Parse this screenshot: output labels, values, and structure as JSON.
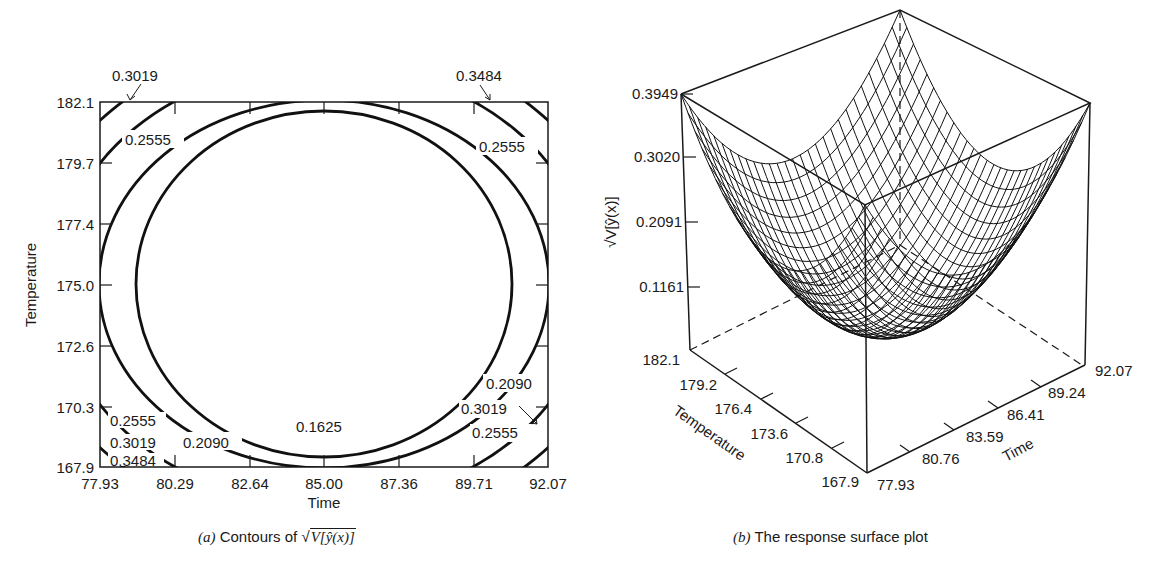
{
  "chart_data": [
    {
      "type": "contour",
      "panel": "(a)",
      "title": "Contours of √V[ŷ(x)]",
      "xlabel": "Time",
      "ylabel": "Temperature",
      "x_ticks": [
        "77.93",
        "80.29",
        "82.64",
        "85.00",
        "87.36",
        "89.71",
        "92.07"
      ],
      "y_ticks": [
        "182.1",
        "179.7",
        "177.4",
        "175.0",
        "172.6",
        "170.3",
        "167.9"
      ],
      "xlim": [
        77.93,
        92.07
      ],
      "ylim": [
        167.9,
        182.1
      ],
      "contour_levels": [
        0.1625,
        0.209,
        0.2555,
        0.3019,
        0.3484
      ],
      "contour_labels": [
        {
          "text": "0.3019",
          "position": "top-left (arrow)"
        },
        {
          "text": "0.3484",
          "position": "top-right (arrow)"
        },
        {
          "text": "0.2555",
          "position": "upper-left"
        },
        {
          "text": "0.2555",
          "position": "upper-right"
        },
        {
          "text": "0.2555",
          "position": "lower-left"
        },
        {
          "text": "0.3019",
          "position": "lower-left"
        },
        {
          "text": "0.3484",
          "position": "lower-left"
        },
        {
          "text": "0.2090",
          "position": "lower-left"
        },
        {
          "text": "0.1625",
          "position": "bottom-center"
        },
        {
          "text": "0.2090",
          "position": "lower-right"
        },
        {
          "text": "0.3019",
          "position": "lower-right"
        },
        {
          "text": "0.2555",
          "position": "lower-right (arrow)"
        }
      ],
      "center": {
        "time": 85.0,
        "temperature": 175.0
      },
      "grid": false
    },
    {
      "type": "surface3d",
      "panel": "(b)",
      "title": "The response surface plot",
      "xlabel": "Time",
      "ylabel": "Temperature",
      "zlabel": "√V[ŷ(x)]",
      "x_ticks": [
        "77.93",
        "80.76",
        "83.59",
        "86.41",
        "89.24",
        "92.07"
      ],
      "y_ticks": [
        "182.1",
        "179.2",
        "176.4",
        "173.6",
        "170.8",
        "167.9"
      ],
      "z_ticks": [
        "0.3949",
        "0.3020",
        "0.2091",
        "0.1161"
      ],
      "zlim": [
        0.1161,
        0.3949
      ],
      "shape": "bowl (minimum at center 85.00, 175.0; maxima at corners 0.3949)"
    }
  ],
  "panel_a": {
    "ylabel": "Temperature",
    "xlabel": "Time",
    "y_ticks": [
      "182.1",
      "179.7",
      "177.4",
      "175.0",
      "172.6",
      "170.3",
      "167.9"
    ],
    "x_ticks": [
      "77.93",
      "80.29",
      "82.64",
      "85.00",
      "87.36",
      "89.71",
      "92.07"
    ],
    "labels": {
      "tl_arrow": "0.3019",
      "tr_arrow": "0.3484",
      "ul_2555": "0.2555",
      "ur_2555": "0.2555",
      "ll_2555": "0.2555",
      "ll_3019": "0.3019",
      "ll_3484": "0.3484",
      "ll_2090": "0.2090",
      "bc_1625": "0.1625",
      "lr_2090": "0.2090",
      "lr_3019": "0.3019",
      "lr_2555": "0.2555"
    },
    "caption_prefix": "(a)",
    "caption_text": " Contours of ",
    "caption_math": "V[ŷ(x)]"
  },
  "panel_b": {
    "zlabel": "√V[ŷ(x)]",
    "z_ticks": [
      "0.3949",
      "0.3020",
      "0.2091",
      "0.1161"
    ],
    "temp_ticks": [
      "182.1",
      "179.2",
      "176.4",
      "173.6",
      "170.8",
      "167.9"
    ],
    "time_ticks": [
      "77.93",
      "80.76",
      "83.59",
      "86.41",
      "89.24",
      "92.07"
    ],
    "temp_label": "Temperature",
    "time_label": "Time",
    "caption_prefix": "(b)",
    "caption_text": " The response surface plot"
  }
}
